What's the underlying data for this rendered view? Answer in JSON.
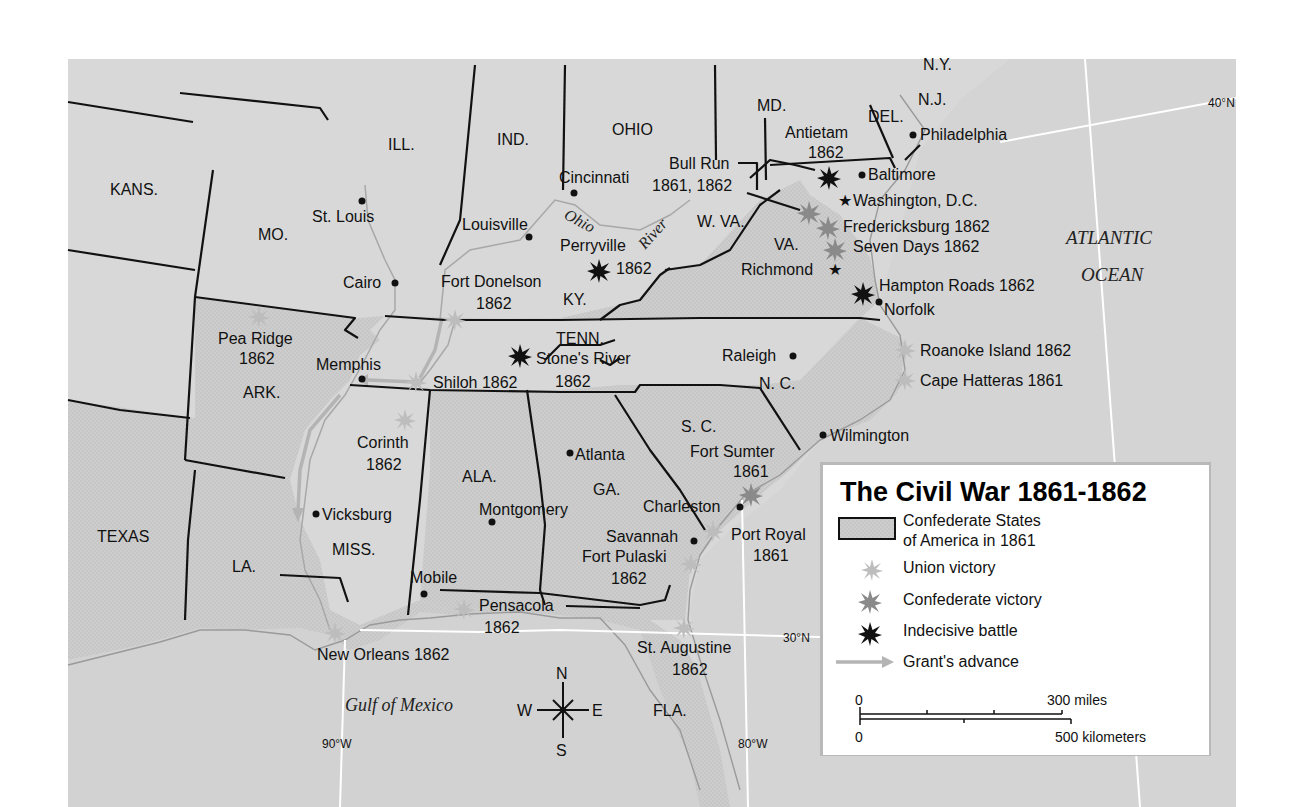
{
  "title": "The Civil War 1861-1862",
  "colors": {
    "union_land": "#d6d6d6",
    "confederate_land": "#cbcbcb",
    "sea": "#d9d9d9",
    "union_victory": "#bdbdbd",
    "confederate_victory": "#8a8a8a",
    "indecisive_battle": "#111111",
    "grants_advance": "#b4b4b4",
    "legend_bg": "#ffffff"
  },
  "legend": {
    "title": "The Civil War 1861-1862",
    "items": [
      {
        "symbol": "confederate-area-swatch",
        "label_line1": "Confederate States",
        "label_line2": "of America in 1861"
      },
      {
        "symbol": "union-victory-star",
        "label": "Union victory"
      },
      {
        "symbol": "confederate-victory-star",
        "label": "Confederate victory"
      },
      {
        "symbol": "indecisive-battle-star",
        "label": "Indecisive battle"
      },
      {
        "symbol": "grants-advance-arrow",
        "label": "Grant's advance"
      }
    ],
    "scale": {
      "miles_zero": "0",
      "miles_label": "300 miles",
      "km_zero": "0",
      "km_label": "500 kilometers"
    }
  },
  "states": {
    "kans": "KANS.",
    "mo": "MO.",
    "ill": "ILL.",
    "ind": "IND.",
    "ohio": "OHIO",
    "md": "MD.",
    "del": "DEL.",
    "nj": "N.J.",
    "ny": "N.Y.",
    "wva": "W. VA.",
    "va": "VA.",
    "ky": "KY.",
    "tenn": "TENN.",
    "nc": "N. C.",
    "sc": "S. C.",
    "ga": "GA.",
    "ala": "ALA.",
    "miss": "MISS.",
    "la": "LA.",
    "ark": "ARK.",
    "texas": "TEXAS",
    "fla": "FLA."
  },
  "cities": {
    "st_louis": "St. Louis",
    "cairo": "Cairo",
    "cincinnati": "Cincinnati",
    "louisville": "Louisville",
    "philadelphia": "Philadelphia",
    "baltimore": "Baltimore",
    "washington": "Washington, D.C.",
    "richmond": "Richmond",
    "norfolk": "Norfolk",
    "memphis": "Memphis",
    "raleigh": "Raleigh",
    "wilmington": "Wilmington",
    "atlanta": "Atlanta",
    "charleston": "Charleston",
    "savannah": "Savannah",
    "montgomery": "Montgomery",
    "vicksburg": "Vicksburg",
    "mobile": "Mobile"
  },
  "battles": [
    {
      "name": "Antietam",
      "year": "1862",
      "result": "indecisive"
    },
    {
      "name": "Bull Run",
      "year": "1861, 1862",
      "result": "confederate"
    },
    {
      "name": "Fredericksburg",
      "year": "1862",
      "result": "confederate"
    },
    {
      "name": "Seven Days",
      "year": "1862",
      "result": "confederate"
    },
    {
      "name": "Hampton Roads",
      "year": "1862",
      "result": "indecisive"
    },
    {
      "name": "Perryville",
      "year": "1862",
      "result": "indecisive"
    },
    {
      "name": "Fort Donelson",
      "year": "1862",
      "result": "union"
    },
    {
      "name": "Pea Ridge",
      "year": "1862",
      "result": "union"
    },
    {
      "name": "Shiloh",
      "year": "1862",
      "result": "union"
    },
    {
      "name": "Stone's River",
      "year": "1862",
      "result": "indecisive"
    },
    {
      "name": "Corinth",
      "year": "1862",
      "result": "union"
    },
    {
      "name": "Roanoke Island",
      "year": "1862",
      "result": "union"
    },
    {
      "name": "Cape Hatteras",
      "year": "1861",
      "result": "union"
    },
    {
      "name": "Fort Sumter",
      "year": "1861",
      "result": "confederate"
    },
    {
      "name": "Port Royal",
      "year": "1861",
      "result": "union"
    },
    {
      "name": "Fort Pulaski",
      "year": "1862",
      "result": "union"
    },
    {
      "name": "Pensacola",
      "year": "1862",
      "result": "union"
    },
    {
      "name": "New Orleans",
      "year": "1862",
      "result": "union"
    },
    {
      "name": "St. Augustine",
      "year": "1862",
      "result": "union"
    }
  ],
  "labels": {
    "antietam": "Antietam",
    "antietam_year": "1862",
    "bull_run": "Bull Run",
    "bull_run_year": "1861, 1862",
    "fredericksburg": "Fredericksburg 1862",
    "seven_days": "Seven Days 1862",
    "hampton_roads": "Hampton Roads 1862",
    "perryville": "Perryville",
    "perryville_year": "1862",
    "fort_donelson": "Fort Donelson",
    "fort_donelson_year": "1862",
    "pea_ridge": "Pea Ridge",
    "pea_ridge_year": "1862",
    "shiloh": "Shiloh 1862",
    "stones_river": "Stone's River",
    "stones_river_year": "1862",
    "corinth": "Corinth",
    "corinth_year": "1862",
    "roanoke": "Roanoke Island 1862",
    "hatteras": "Cape Hatteras 1861",
    "fort_sumter": "Fort Sumter",
    "fort_sumter_year": "1861",
    "port_royal": "Port Royal",
    "port_royal_year": "1861",
    "fort_pulaski": "Fort Pulaski",
    "fort_pulaski_year": "1862",
    "pensacola": "Pensacola",
    "pensacola_year": "1862",
    "new_orleans": "New Orleans 1862",
    "st_augustine": "St. Augustine",
    "st_augustine_year": "1862"
  },
  "water": {
    "ohio_river_1": "Ohio",
    "ohio_river_2": "River",
    "atlantic_1": "ATLANTIC",
    "atlantic_2": "OCEAN",
    "gulf": "Gulf of Mexico"
  },
  "coordinates": {
    "lat40": "40°N",
    "lat30": "30°N",
    "lon90": "90°W",
    "lon80": "80°W"
  },
  "compass": {
    "n": "N",
    "s": "S",
    "e": "E",
    "w": "W"
  }
}
